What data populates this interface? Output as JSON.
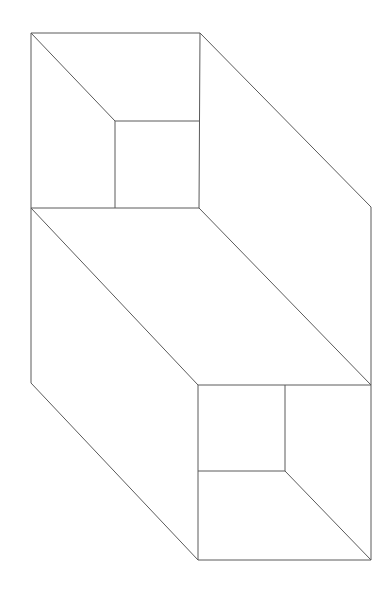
{
  "figure": {
    "type": "wireframe-line-art",
    "canvas": {
      "width": 388,
      "height": 590,
      "background": "#ffffff"
    },
    "stroke": {
      "color": "#5a5a5a",
      "width": 1.0
    },
    "vertices": {
      "top_face_tl": [
        31,
        33
      ],
      "top_face_tr": [
        200,
        33
      ],
      "top_face_br": [
        199,
        208
      ],
      "top_face_bl": [
        31,
        208
      ],
      "top_inner_tl": [
        115,
        121
      ],
      "top_inner_tr": [
        199,
        121
      ],
      "top_inner_br": [
        199,
        208
      ],
      "top_inner_bl": [
        115,
        208
      ],
      "right_upper": [
        371,
        207
      ],
      "right_lower": [
        371,
        385
      ],
      "right_bottom": [
        371,
        560
      ],
      "left_mid": [
        31,
        208
      ],
      "left_bottom": [
        31,
        383
      ],
      "bottom_face_tl": [
        198,
        385
      ],
      "bottom_face_tr": [
        371,
        385
      ],
      "bottom_face_br": [
        371,
        560
      ],
      "bottom_face_bl": [
        198,
        560
      ],
      "bottom_inner_tr": [
        285,
        385
      ],
      "bottom_inner_br": [
        285,
        471
      ],
      "bottom_inner_bl": [
        198,
        471
      ]
    },
    "segments": [
      {
        "name": "top-face-top-edge",
        "kind": "horizontal",
        "from": [
          31,
          33
        ],
        "to": [
          200,
          33
        ]
      },
      {
        "name": "top-face-left-edge",
        "kind": "vertical",
        "from": [
          31,
          33
        ],
        "to": [
          31,
          208
        ]
      },
      {
        "name": "top-face-bottom-edge",
        "kind": "horizontal",
        "from": [
          31,
          208
        ],
        "to": [
          199,
          208
        ]
      },
      {
        "name": "top-face-right-edge",
        "kind": "vertical",
        "from": [
          200,
          33
        ],
        "to": [
          199,
          208
        ]
      },
      {
        "name": "top-notch-diagonal",
        "kind": "diagonal",
        "from": [
          31,
          33
        ],
        "to": [
          115,
          121
        ]
      },
      {
        "name": "top-inner-top-edge",
        "kind": "horizontal",
        "from": [
          115,
          121
        ],
        "to": [
          199,
          121
        ]
      },
      {
        "name": "top-inner-left-edge",
        "kind": "vertical",
        "from": [
          115,
          121
        ],
        "to": [
          115,
          208
        ]
      },
      {
        "name": "upper-right-diagonal",
        "kind": "diagonal",
        "from": [
          200,
          33
        ],
        "to": [
          371,
          207
        ]
      },
      {
        "name": "right-upper-vertical",
        "kind": "vertical",
        "from": [
          371,
          207
        ],
        "to": [
          371,
          385
        ]
      },
      {
        "name": "mid-body-diagonal",
        "kind": "diagonal",
        "from": [
          31,
          208
        ],
        "to": [
          198,
          385
        ]
      },
      {
        "name": "mid-right-diagonal",
        "kind": "diagonal",
        "from": [
          199,
          208
        ],
        "to": [
          371,
          385
        ]
      },
      {
        "name": "left-lower-vertical",
        "kind": "vertical",
        "from": [
          31,
          208
        ],
        "to": [
          31,
          383
        ]
      },
      {
        "name": "lower-left-diagonal",
        "kind": "diagonal",
        "from": [
          31,
          383
        ],
        "to": [
          198,
          560
        ]
      },
      {
        "name": "bottom-face-top-edge",
        "kind": "horizontal",
        "from": [
          198,
          385
        ],
        "to": [
          371,
          385
        ]
      },
      {
        "name": "bottom-face-left-edge",
        "kind": "vertical",
        "from": [
          198,
          385
        ],
        "to": [
          198,
          560
        ]
      },
      {
        "name": "bottom-face-bottom-edge",
        "kind": "horizontal",
        "from": [
          198,
          560
        ],
        "to": [
          371,
          560
        ]
      },
      {
        "name": "bottom-face-right-edge",
        "kind": "vertical",
        "from": [
          371,
          385
        ],
        "to": [
          371,
          560
        ]
      },
      {
        "name": "bottom-inner-right-edge",
        "kind": "vertical",
        "from": [
          285,
          385
        ],
        "to": [
          285,
          471
        ]
      },
      {
        "name": "bottom-inner-bottom-edge",
        "kind": "horizontal",
        "from": [
          198,
          471
        ],
        "to": [
          285,
          471
        ]
      },
      {
        "name": "bottom-notch-diagonal",
        "kind": "diagonal",
        "from": [
          285,
          471
        ],
        "to": [
          371,
          560
        ]
      }
    ]
  }
}
